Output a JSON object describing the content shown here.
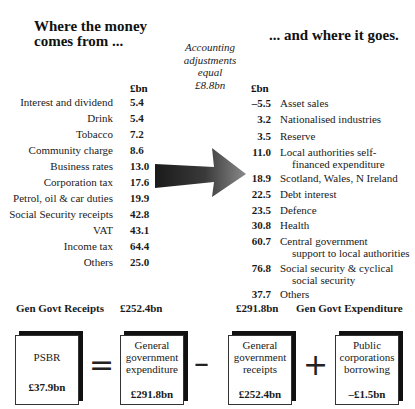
{
  "left_title": [
    "Where the money",
    "comes from ..."
  ],
  "right_title": "... and where it goes.",
  "note": [
    "Accounting",
    "adjustments",
    "equal",
    "£8.8bn"
  ],
  "unit_header": "£bn",
  "receipts": [
    {
      "label": "Interest and dividend",
      "value": "5.4"
    },
    {
      "label": "Drink",
      "value": "5.4"
    },
    {
      "label": "Tobacco",
      "value": "7.2"
    },
    {
      "label": "Community charge",
      "value": "8.6"
    },
    {
      "label": "Business rates",
      "value": "13.0"
    },
    {
      "label": "Corporation tax",
      "value": "17.6"
    },
    {
      "label": "Petrol, oil & car duties",
      "value": "19.9"
    },
    {
      "label": "Social Security receipts",
      "value": "42.8"
    },
    {
      "label": "VAT",
      "value": "43.1"
    },
    {
      "label": "Income tax",
      "value": "64.4"
    },
    {
      "label": "Others",
      "value": "25.0"
    }
  ],
  "expenditure": [
    {
      "value": "–5.5",
      "label": "Asset sales",
      "cont": ""
    },
    {
      "value": "3.2",
      "label": "Nationalised industries",
      "cont": ""
    },
    {
      "value": "3.5",
      "label": "Reserve",
      "cont": ""
    },
    {
      "value": "11.0",
      "label": "Local authorities self-",
      "cont": "financed expenditure"
    },
    {
      "value": "18.9",
      "label": "Scotland, Wales, N Ireland",
      "cont": ""
    },
    {
      "value": "22.5",
      "label": "Debt interest",
      "cont": ""
    },
    {
      "value": "23.5",
      "label": "Defence",
      "cont": ""
    },
    {
      "value": "30.8",
      "label": "Health",
      "cont": ""
    },
    {
      "value": "60.7",
      "label": "Central government",
      "cont": "support to local authorities"
    },
    {
      "value": "76.8",
      "label": "Social security & cyclical",
      "cont": "social security"
    },
    {
      "value": "37.7",
      "label": "Others",
      "cont": ""
    }
  ],
  "totals": {
    "receipts_label": "Gen Govt Receipts",
    "receipts_value": "£252.4bn",
    "expenditure_value": "£291.8bn",
    "expenditure_label": "Gen Govt Expenditure"
  },
  "equation": {
    "boxes": [
      {
        "lines": [
          "PSBR"
        ],
        "amount": "£37.9bn"
      },
      {
        "lines": [
          "General",
          "government",
          "expenditure"
        ],
        "amount": "£291.8bn"
      },
      {
        "lines": [
          "General",
          "government",
          "receipts"
        ],
        "amount": "£252.4bn"
      },
      {
        "lines": [
          "Public",
          "corporations",
          "borrowing"
        ],
        "amount": "–£1.5bn"
      }
    ],
    "operators": [
      "=",
      "–",
      "+"
    ]
  }
}
